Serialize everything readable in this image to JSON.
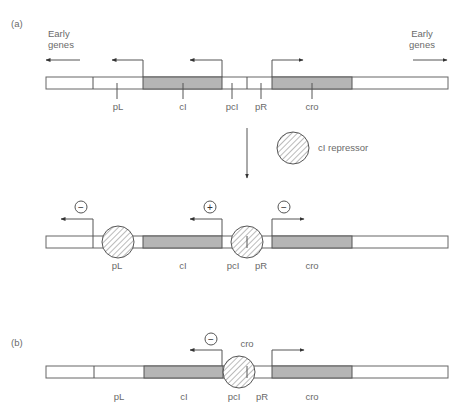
{
  "panels": {
    "a": {
      "label": "(a)",
      "early_genes_left": "Early genes",
      "early_genes_left_lines": [
        "Early",
        "genes"
      ],
      "early_genes_right_lines": [
        "Early",
        "genes"
      ],
      "top_labels": [
        "pL",
        "cI",
        "pcI",
        "pR",
        "cro"
      ],
      "repressor_label": "cI repressor",
      "bound_labels": [
        "pL",
        "cI",
        "pcI",
        "pR",
        "cro"
      ],
      "bound_signs": {
        "pL": "−",
        "pcI": "+",
        "pR": "−"
      }
    },
    "b": {
      "label": "(b)",
      "labels": [
        "pL",
        "cI",
        "pcI",
        "pR",
        "cro"
      ],
      "bound_protein": "cro",
      "sign_pcI": "−"
    }
  },
  "colors": {
    "gene_fill": "#b5b5b5",
    "line": "#555555",
    "text": "#6a6a6a"
  }
}
